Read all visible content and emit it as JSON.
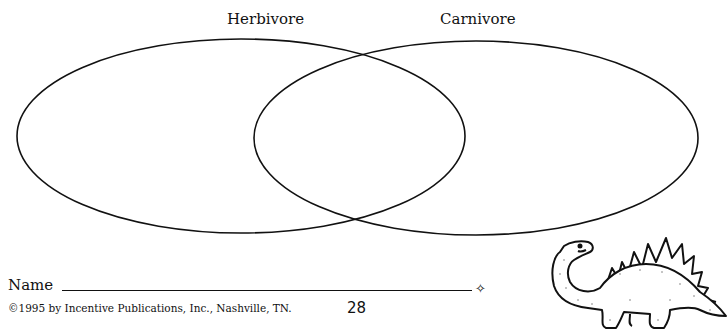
{
  "venn": {
    "left_label": "Herbivore",
    "right_label": "Carnivore"
  },
  "footer": {
    "name_label": "Name",
    "diamond": "✧",
    "copyright": "©1995 by Incentive Publications, Inc., Nashville, TN.",
    "page_number": "28"
  },
  "illustration": "stegosaurus-dinosaur"
}
